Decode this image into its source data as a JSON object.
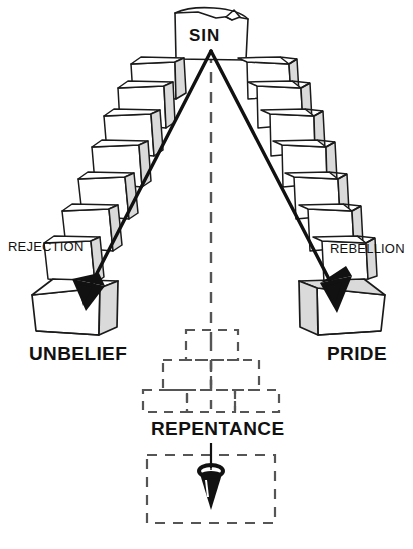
{
  "diagram": {
    "title_node": {
      "label": "SIN"
    },
    "arch": {
      "left_arm": {
        "path_label": "REJECTION",
        "base_label": "UNBELIEF"
      },
      "right_arm": {
        "path_label": "REBELLION",
        "base_label": "PRIDE"
      }
    },
    "center": {
      "axis_style": "dashed",
      "pyramid_label": "REPENTANCE",
      "pyramid_tiers": 3,
      "bottom_box_style": "dashed"
    },
    "colors": {
      "ink": "#111111",
      "stone_fill": "#ffffff",
      "stone_stroke": "#1a1a1a",
      "shade_fill": "#d8d8d8",
      "dashed": "#555555",
      "arrow_fill": "#111111"
    }
  },
  "labels": {
    "sin": "SIN",
    "rejection": "REJECTION",
    "rebellion": "REBELLION",
    "unbelief": "UNBELIEF",
    "pride": "PRIDE",
    "repentance": "REPENTANCE"
  }
}
